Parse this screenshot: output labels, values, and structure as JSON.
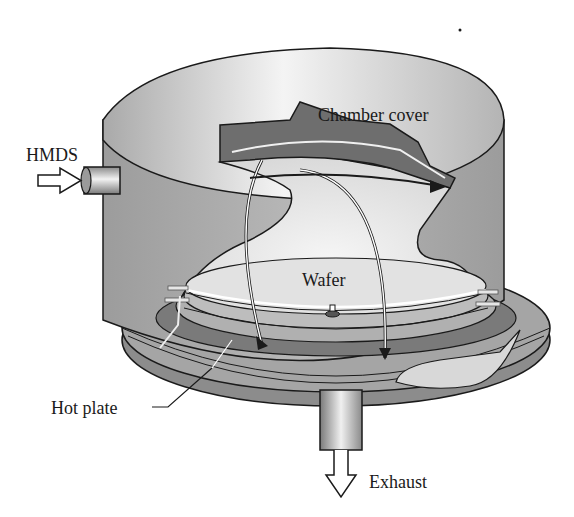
{
  "diagram": {
    "type": "cutaway-illustration",
    "labels": {
      "chamber_cover": "Chamber cover",
      "hmds": "HMDS",
      "wafer": "Wafer",
      "hot_plate": "Hot plate",
      "exhaust": "Exhaust"
    },
    "components": [
      {
        "id": "chamber-cover",
        "label": "Chamber cover"
      },
      {
        "id": "hmds-inlet",
        "label": "HMDS",
        "flow": "in"
      },
      {
        "id": "wafer",
        "label": "Wafer"
      },
      {
        "id": "hot-plate",
        "label": "Hot plate"
      },
      {
        "id": "exhaust-outlet",
        "label": "Exhaust",
        "flow": "out"
      }
    ],
    "colors": {
      "background": "#ffffff",
      "cover_light": "#e6e6e6",
      "cover_mid": "#bdbdbd",
      "cover_dark": "#9a9a9a",
      "baffle_dark": "#6e6e6e",
      "outline": "#1a1a1a",
      "text": "#1a1a1a"
    }
  }
}
